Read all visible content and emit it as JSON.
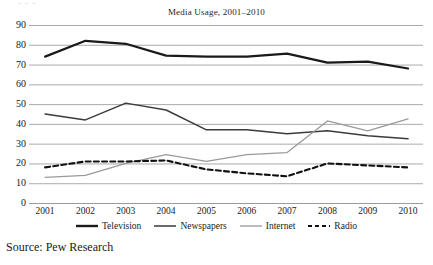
{
  "figure": {
    "title": "Media  Usage, 2001–2010",
    "source_note": "Source: Pew Research",
    "top_artifact": "- - -"
  },
  "legend": {
    "position": "bottom",
    "items": [
      {
        "label": "Television",
        "style": "solid",
        "color": "#1a1a1a",
        "width": 2.4
      },
      {
        "label": "Newspapers",
        "style": "solid",
        "color": "#3b3b3b",
        "width": 1.5
      },
      {
        "label": "Internet",
        "style": "solid",
        "color": "#9a9a9a",
        "width": 1.3
      },
      {
        "label": "Radio",
        "style": "dashed",
        "color": "#111111",
        "width": 2.2
      }
    ]
  },
  "axes": {
    "y_ticks": [
      "0",
      "10",
      "20",
      "30",
      "40",
      "50",
      "60",
      "70",
      "80",
      "90"
    ],
    "x_ticks": [
      "2001",
      "2002",
      "2003",
      "2004",
      "2005",
      "2006",
      "2007",
      "2008",
      "2009",
      "2010"
    ],
    "ylim": [
      0,
      90
    ],
    "grid": true,
    "grid_color": "#9b9b9b"
  },
  "chart_data": {
    "type": "line",
    "title": "Media  Usage, 2001–2010",
    "xlabel": "",
    "ylabel": "",
    "ylim": [
      0,
      90
    ],
    "grid": true,
    "legend_position": "bottom",
    "categories": [
      "2001",
      "2002",
      "2003",
      "2004",
      "2005",
      "2006",
      "2007",
      "2008",
      "2009",
      "2010"
    ],
    "series": [
      {
        "name": "Television",
        "color": "#1a1a1a",
        "style": "solid",
        "values": [
          74,
          82,
          80.5,
          74.5,
          74,
          74,
          75.5,
          71,
          71.5,
          68
        ]
      },
      {
        "name": "Newspapers",
        "color": "#3b3b3b",
        "style": "solid",
        "values": [
          45,
          42,
          50.5,
          47,
          37,
          37,
          35,
          36.5,
          34,
          32.5
        ]
      },
      {
        "name": "Internet",
        "color": "#9a9a9a",
        "style": "solid",
        "values": [
          13,
          14,
          20,
          24.5,
          21,
          24.5,
          25.5,
          41.5,
          36.5,
          42.5
        ]
      },
      {
        "name": "Radio",
        "color": "#111111",
        "style": "dashed",
        "values": [
          18,
          21,
          21,
          21.5,
          17,
          15,
          13.5,
          20,
          19,
          18
        ]
      }
    ]
  }
}
